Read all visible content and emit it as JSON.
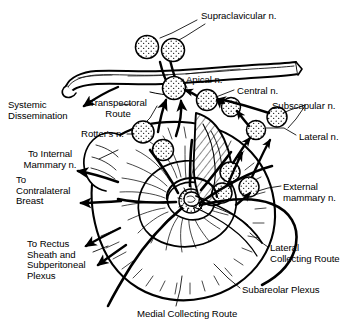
{
  "figure": {
    "kind": "medical-line-diagram",
    "ink_color": "#000000",
    "background_color": "#ffffff",
    "width": 356,
    "height": 326
  },
  "labels": [
    {
      "id": "supraclavicular",
      "text": "Supraclavicular n.",
      "x": 201,
      "y": 11,
      "align": "left"
    },
    {
      "id": "apical",
      "text": "Apical n.",
      "x": 186,
      "y": 75,
      "align": "left"
    },
    {
      "id": "central",
      "text": "Central n.",
      "x": 237,
      "y": 86,
      "align": "left"
    },
    {
      "id": "subscapular",
      "text": "Subscapular n.",
      "x": 272,
      "y": 101,
      "align": "left"
    },
    {
      "id": "lateral",
      "text": "Lateral n.",
      "x": 299,
      "y": 132,
      "align": "left"
    },
    {
      "id": "systemic",
      "text": "Systemic\nDissemination",
      "x": 8,
      "y": 100,
      "align": "left"
    },
    {
      "id": "transpectoral",
      "text": "Transpectoral\nRoute",
      "x": 90,
      "y": 98,
      "align": "center"
    },
    {
      "id": "rotters",
      "text": "Rotter's n.",
      "x": 81,
      "y": 129,
      "align": "left"
    },
    {
      "id": "internal_mammary",
      "text": "To Internal\nMammary n.",
      "x": 36,
      "y": 149,
      "align": "center"
    },
    {
      "id": "contralateral",
      "text": "To\nContralateral\nBreast",
      "x": 16,
      "y": 175,
      "align": "left"
    },
    {
      "id": "external_mammary",
      "text": "External\nmammary n.",
      "x": 283,
      "y": 182,
      "align": "left"
    },
    {
      "id": "rectus_sheath",
      "text": "To Rectus\nSheath and\nSubperitoneal\nPlexus",
      "x": 27,
      "y": 239,
      "align": "left"
    },
    {
      "id": "lateral_route",
      "text": "Lateral\nCollecting Route",
      "x": 270,
      "y": 243,
      "align": "left"
    },
    {
      "id": "subareolar",
      "text": "Subareolar Plexus",
      "x": 242,
      "y": 285,
      "align": "left"
    },
    {
      "id": "medial_route",
      "text": "Medial Collecting Route",
      "x": 137,
      "y": 309,
      "align": "left"
    }
  ],
  "anatomy": {
    "clavicle": {
      "name": "clavicle-bone"
    },
    "breast": {
      "name": "breast-outline"
    },
    "nipple": {
      "name": "nipple-areola-complex"
    },
    "pectoral": {
      "name": "pectoral-muscle"
    }
  },
  "lymph_nodes": [
    {
      "id": "supraclav-1",
      "name": "supraclavicular-node-1",
      "cx": 147,
      "cy": 47,
      "r": 11.5
    },
    {
      "id": "supraclav-2",
      "name": "supraclavicular-node-2",
      "cx": 173,
      "cy": 50,
      "r": 11.5
    },
    {
      "id": "apical",
      "name": "apical-node",
      "cx": 174,
      "cy": 88,
      "r": 11.5
    },
    {
      "id": "central",
      "name": "central-node",
      "cx": 207,
      "cy": 100,
      "r": 10.5
    },
    {
      "id": "infraclav",
      "name": "infraclavicular-node",
      "cx": 231,
      "cy": 107,
      "r": 9.5
    },
    {
      "id": "subscapular",
      "name": "subscapular-node",
      "cx": 277,
      "cy": 117,
      "r": 10.0
    },
    {
      "id": "lateral",
      "name": "lateral-node",
      "cx": 256,
      "cy": 130,
      "r": 9.5
    },
    {
      "id": "rotters",
      "name": "rotters-node",
      "cx": 143,
      "cy": 132,
      "r": 11.0
    },
    {
      "id": "pectoral-2",
      "name": "interpectoral-node",
      "cx": 163,
      "cy": 150,
      "r": 10.5
    },
    {
      "id": "extmam-1",
      "name": "external-mammary-node-1",
      "cx": 230,
      "cy": 172,
      "r": 10.0
    },
    {
      "id": "extmam-2",
      "name": "external-mammary-node-2",
      "cx": 249,
      "cy": 187,
      "r": 10.0
    },
    {
      "id": "extmam-3",
      "name": "external-mammary-node-3",
      "cx": 222,
      "cy": 193,
      "r": 10.0
    }
  ],
  "routes": [
    {
      "id": "r-systemic",
      "name": "systemic-dissemination-arrow"
    },
    {
      "id": "r-internal",
      "name": "internal-mammary-arrow"
    },
    {
      "id": "r-contralateral",
      "name": "contralateral-breast-arrow"
    },
    {
      "id": "r-rectus",
      "name": "rectus-sheath-arrow"
    },
    {
      "id": "r-lateral",
      "name": "lateral-collecting-route-path"
    },
    {
      "id": "r-medial",
      "name": "medial-collecting-route-path"
    },
    {
      "id": "r-transpectoral",
      "name": "transpectoral-route-arrow"
    }
  ]
}
